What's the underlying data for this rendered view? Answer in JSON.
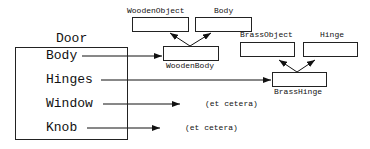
{
  "container": {
    "title": "Door",
    "fields": [
      {
        "label": "Body"
      },
      {
        "label": "Hinges"
      },
      {
        "label": "Window"
      },
      {
        "label": "Knob"
      }
    ]
  },
  "classes": {
    "wooden_object": "WoodenObject",
    "body": "Body",
    "wooden_body": "WoodenBody",
    "brass_object": "BrassObject",
    "hinge": "Hinge",
    "brass_hinge": "BrassHinge"
  },
  "annotations": {
    "window_target": "(et cetera)",
    "knob_target": "(et cetera)"
  }
}
